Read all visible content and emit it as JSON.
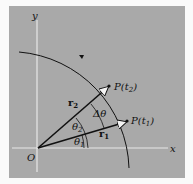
{
  "diagram": {
    "axes": {
      "x_label": "x",
      "y_label": "y",
      "origin_label": "O"
    },
    "vectors": [
      {
        "label": "r",
        "sub": "1",
        "point": "P(t",
        "point_sub": "1",
        "point_close": ")"
      },
      {
        "label": "r",
        "sub": "2",
        "point": "P(t",
        "point_sub": "2",
        "point_close": ")"
      }
    ],
    "angles": [
      {
        "label": "θ",
        "sub": "1"
      },
      {
        "label": "θ",
        "sub": "2"
      },
      {
        "label": "Δθ"
      }
    ],
    "colors": {
      "panel": "#a9a9a9",
      "axis": "#e8e8e8",
      "ink": "#111111"
    }
  }
}
